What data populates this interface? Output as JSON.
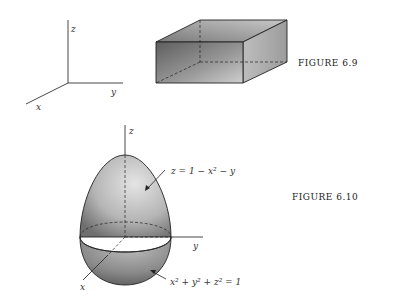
{
  "figure_6_9": {
    "axes_labels": {
      "z": "z",
      "y": "y",
      "x": "x"
    },
    "caption": "FIGURE 6.9"
  },
  "figure_6_10": {
    "axes_labels": {
      "z": "z",
      "y": "y",
      "x": "x"
    },
    "upper_surface_label": "z = 1 − x² − y",
    "lower_surface_label": "x² + y² + z² = 1",
    "caption": "FIGURE 6.10"
  },
  "colors": {
    "line": "#222222",
    "shade_dark": "#6e6e6e",
    "shade_light": "#e6e6e6"
  }
}
